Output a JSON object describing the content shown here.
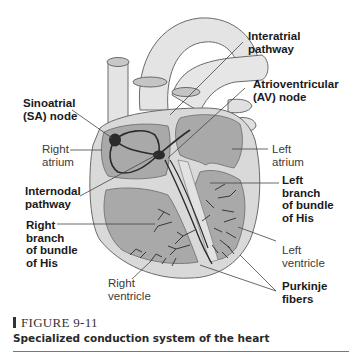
{
  "figure": {
    "number": "FIGURE 9-11",
    "caption": "Specialized conduction system of the heart"
  },
  "labels": {
    "interatrial": "Interatrial\npathway",
    "av_node": "Atrioventricular\n(AV) node",
    "sa_node": "Sinoatrial\n(SA) node",
    "right_atrium": "Right\natrium",
    "left_atrium": "Left\natrium",
    "internodal": "Internodal\npathway",
    "left_branch": "Left\nbranch\nof bundle\nof His",
    "right_branch": "Right\nbranch\nof bundle\nof His",
    "left_ventricle": "Left\nventricle",
    "right_ventricle": "Right\nventricle",
    "purkinje": "Purkinje\nfibers"
  },
  "colors": {
    "outline": "#6a6a6a",
    "vessel_fill": "#e4e4e4",
    "heart_wall": "#d9d9d9",
    "chamber": "#a9a9a9",
    "conduction": "#2b2b2b",
    "leader": "#444444"
  }
}
